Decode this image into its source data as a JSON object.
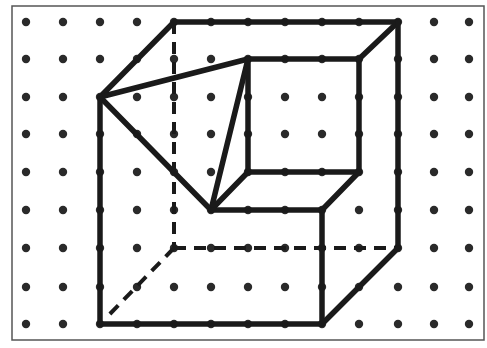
{
  "colors": {
    "background": "#ffffff",
    "border": "#555555",
    "dot": "#2a2a2a",
    "line": "#1a1a1a"
  },
  "border": {
    "x": 12,
    "y": 6,
    "width": 472,
    "height": 334
  },
  "grid": {
    "columns_x": [
      26,
      63,
      100,
      137,
      174,
      211,
      248,
      285,
      322,
      359,
      398,
      434,
      469
    ],
    "rows_y": [
      22,
      59,
      97,
      134,
      172,
      210,
      248,
      287,
      324
    ],
    "dot_radius": 4.2
  },
  "solid_edges": [
    [
      [
        174,
        22
      ],
      [
        398,
        22
      ]
    ],
    [
      [
        174,
        22
      ],
      [
        100,
        97
      ]
    ],
    [
      [
        100,
        97
      ],
      [
        248,
        59
      ]
    ],
    [
      [
        100,
        97
      ],
      [
        211,
        210
      ]
    ],
    [
      [
        100,
        97
      ],
      [
        100,
        324
      ]
    ],
    [
      [
        248,
        59
      ],
      [
        359,
        59
      ]
    ],
    [
      [
        359,
        59
      ],
      [
        398,
        22
      ]
    ],
    [
      [
        398,
        22
      ],
      [
        398,
        248
      ]
    ],
    [
      [
        248,
        59
      ],
      [
        248,
        172
      ]
    ],
    [
      [
        359,
        59
      ],
      [
        359,
        172
      ]
    ],
    [
      [
        248,
        172
      ],
      [
        359,
        172
      ]
    ],
    [
      [
        248,
        59
      ],
      [
        211,
        210
      ]
    ],
    [
      [
        211,
        210
      ],
      [
        248,
        172
      ]
    ],
    [
      [
        211,
        210
      ],
      [
        322,
        210
      ]
    ],
    [
      [
        359,
        172
      ],
      [
        322,
        210
      ]
    ],
    [
      [
        322,
        210
      ],
      [
        322,
        324
      ]
    ],
    [
      [
        100,
        324
      ],
      [
        322,
        324
      ]
    ],
    [
      [
        322,
        324
      ],
      [
        398,
        248
      ]
    ]
  ],
  "dashed_edges": [
    [
      [
        174,
        22
      ],
      [
        174,
        248
      ]
    ],
    [
      [
        174,
        248
      ],
      [
        398,
        248
      ]
    ],
    [
      [
        174,
        248
      ],
      [
        106,
        318
      ]
    ]
  ]
}
